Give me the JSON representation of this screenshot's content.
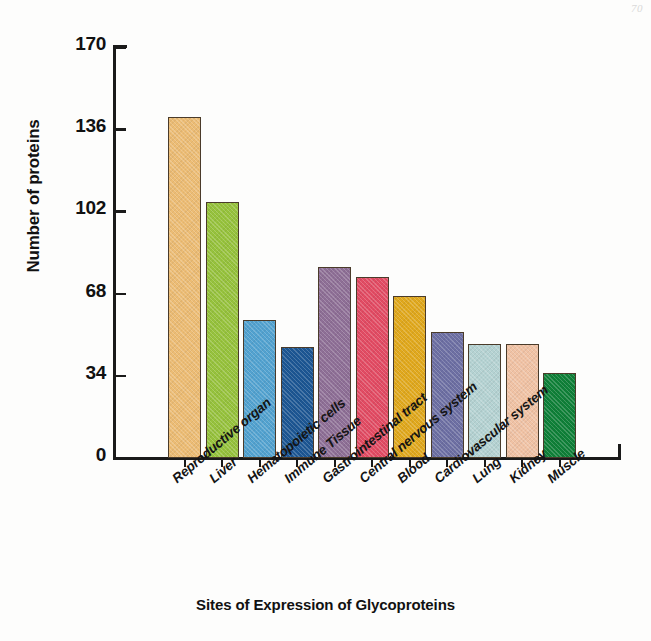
{
  "page_mark": "70",
  "chart_data": {
    "type": "bar",
    "title": "",
    "xlabel": "Sites of Expression of Glycoproteins",
    "ylabel": "Number of proteins",
    "ylim": [
      0,
      170
    ],
    "yticks": [
      0,
      34,
      68,
      102,
      136,
      170
    ],
    "grid": false,
    "legend": "none",
    "categories": [
      "Reproductive organ",
      "Liver",
      "Hematopoietic cells",
      "Immune Tissue",
      "Gastrointestinal tract",
      "Central nervous system",
      "Blood",
      "Cardiovascular system",
      "Lung",
      "Kidney",
      "Muscle"
    ],
    "values": [
      141,
      106,
      57,
      46,
      79,
      75,
      67,
      52,
      47,
      47,
      35
    ],
    "colors": [
      "#ecbc74",
      "#96c23c",
      "#52a2d0",
      "#1c5693",
      "#8e6f96",
      "#e24b63",
      "#e0a81c",
      "#6d6fa3",
      "#b4d2d2",
      "#f0c2a4",
      "#0f8038"
    ]
  }
}
